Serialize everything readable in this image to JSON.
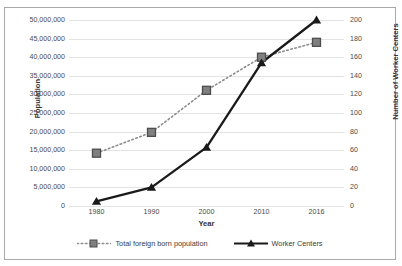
{
  "chart_data": {
    "type": "line",
    "title": "",
    "xlabel": "Year",
    "categories": [
      "1980",
      "1990",
      "2000",
      "2010",
      "2016"
    ],
    "grid": "horizontal",
    "legend_position": "bottom",
    "axes": {
      "left": {
        "label": "Population",
        "min": 0,
        "max": 50000000,
        "step": 5000000,
        "ticks": [
          "0",
          "5,000,000",
          "10,000,000",
          "15,000,000",
          "20,000,000",
          "25,000,000",
          "30,000,000",
          "35,000,000",
          "40,000,000",
          "45,000,000",
          "50,000,000"
        ]
      },
      "right": {
        "label": "Number of Worker Centers",
        "min": 0,
        "max": 200,
        "step": 20,
        "ticks": [
          "0",
          "20",
          "40",
          "60",
          "80",
          "100",
          "120",
          "140",
          "160",
          "180",
          "200"
        ]
      }
    },
    "series": [
      {
        "name": "Total foreign born population",
        "axis": "left",
        "line_style": "dotted",
        "marker": "square",
        "color": "#808080",
        "values": [
          14200000,
          19800000,
          31100000,
          40000000,
          44000000
        ]
      },
      {
        "name": "Worker Centers",
        "axis": "right",
        "line_style": "solid",
        "marker": "triangle",
        "color": "#1a1a1a",
        "values": [
          5,
          20,
          63,
          154,
          200
        ]
      }
    ]
  },
  "legend": {
    "entries": [
      {
        "label": "Total foreign born population"
      },
      {
        "label": "Worker Centers"
      }
    ]
  }
}
